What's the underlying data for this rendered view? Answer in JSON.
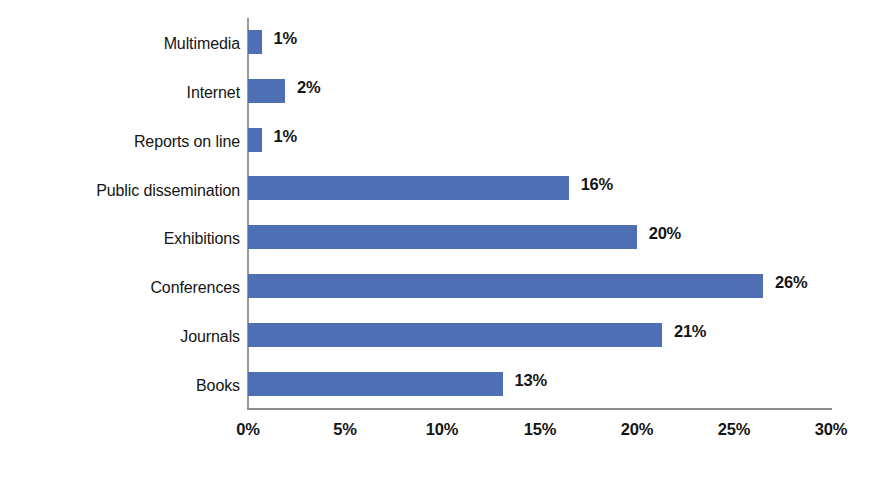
{
  "chart_data": {
    "type": "bar",
    "orientation": "horizontal",
    "title": "",
    "xlabel": "",
    "ylabel": "",
    "categories": [
      "Multimedia",
      "Internet",
      "Reports on line",
      "Public dissemination",
      "Exhibitions",
      "Conferences",
      "Journals",
      "Books"
    ],
    "values": [
      1,
      2,
      1,
      16,
      20,
      26,
      21,
      13
    ],
    "value_labels": [
      "1%",
      "2%",
      "1%",
      "16%",
      "20%",
      "26%",
      "21%",
      "13%"
    ],
    "bar_extents_percent": [
      0.7,
      1.9,
      0.7,
      16.5,
      20.0,
      26.5,
      21.3,
      13.1
    ],
    "xlim": [
      0,
      30
    ],
    "xticks": [
      0,
      5,
      10,
      15,
      20,
      25,
      30
    ],
    "xtick_labels": [
      "0%",
      "5%",
      "10%",
      "15%",
      "20%",
      "25%",
      "30%"
    ],
    "grid": false,
    "legend": null,
    "colors": {
      "bar": "#4f6fb4",
      "axis": "#8d8d89",
      "text": "#151515",
      "background": "#ffffff"
    }
  }
}
